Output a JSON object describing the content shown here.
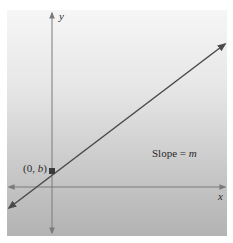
{
  "diagram": {
    "axis_labels": {
      "x": "x",
      "y": "y"
    },
    "intercept_label": {
      "prefix": "(0, ",
      "var": "b",
      "suffix": ")"
    },
    "slope_label": {
      "text": "Slope = ",
      "var": "m"
    },
    "colors": {
      "line": "#4a4a4a",
      "axes": "#7a7a7a",
      "point": "#3a3a3a",
      "bg_top": "#f6f6f6",
      "bg_bottom": "#b3b3b3"
    }
  }
}
